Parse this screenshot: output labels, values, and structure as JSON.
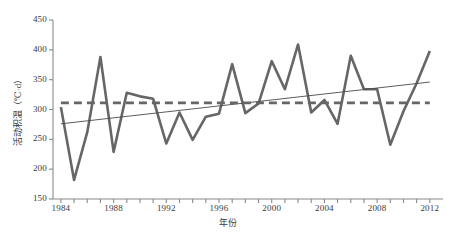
{
  "chart_data": {
    "type": "line",
    "title": "",
    "xlabel": "年份",
    "ylabel": "活动积温（℃·d）",
    "xlim": [
      1983.4,
      2013.0
    ],
    "ylim": [
      150,
      450
    ],
    "yticks": [
      150,
      200,
      250,
      300,
      350,
      400,
      450
    ],
    "xticks": [
      1984,
      1988,
      1992,
      1996,
      2000,
      2004,
      2008,
      2012
    ],
    "xtick_minor_every": 1,
    "grid": false,
    "legend": "none",
    "series": [
      {
        "name": "活动积温",
        "style": "solid-thick",
        "color": "#666666",
        "x": [
          1984,
          1985,
          1986,
          1987,
          1988,
          1989,
          1990,
          1991,
          1992,
          1993,
          1994,
          1995,
          1996,
          1997,
          1998,
          1999,
          2000,
          2001,
          2002,
          2003,
          2004,
          2005,
          2006,
          2007,
          2008,
          2009,
          2010,
          2011,
          2012
        ],
        "values": [
          304,
          182,
          262,
          388,
          229,
          328,
          322,
          318,
          243,
          295,
          249,
          288,
          293,
          376,
          294,
          310,
          381,
          334,
          409,
          295,
          316,
          276,
          390,
          334,
          334,
          241,
          297,
          344,
          398
        ]
      },
      {
        "name": "趋势线",
        "style": "solid-thin",
        "color": "#4a4a4a",
        "x": [
          1984,
          2012
        ],
        "values": [
          276,
          346
        ]
      },
      {
        "name": "平均值",
        "style": "dashed-thick",
        "color": "#666666",
        "x": [
          1984,
          2012
        ],
        "values": [
          311,
          311
        ]
      }
    ],
    "axis_color": "#8a8a8a",
    "text_color": "#3a3a3a"
  },
  "ytick_labels": [
    "450",
    "400",
    "350",
    "300",
    "250",
    "200",
    "150"
  ],
  "xtick_labels": [
    "1984",
    "1988",
    "1992",
    "1996",
    "2000",
    "2004",
    "2008",
    "2012"
  ]
}
